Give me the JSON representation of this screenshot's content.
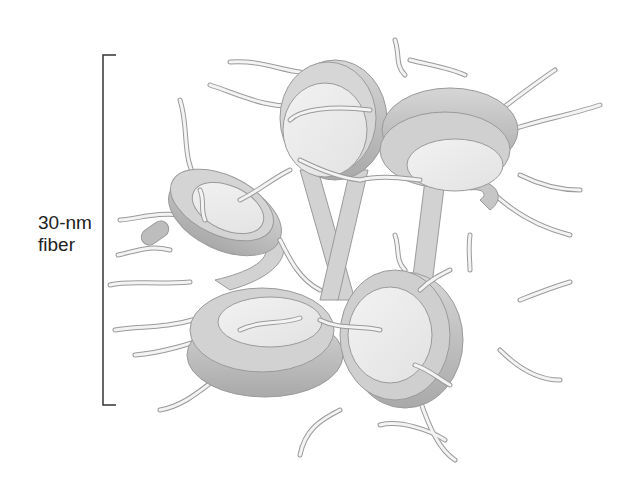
{
  "figure": {
    "label_line1": "30-nm",
    "label_line2": "fiber",
    "colors": {
      "background": "#ffffff",
      "bracket": "#333333",
      "disc_face": "#ededed",
      "dna_band": "#c8c8c8",
      "dna_band_dark": "#a8a8a8",
      "tail": "#e4e4e4",
      "outline": "#9a9a9a"
    },
    "components": [
      "nucleosome-discs",
      "linker-dna",
      "histone-tails",
      "scale-bracket"
    ]
  }
}
